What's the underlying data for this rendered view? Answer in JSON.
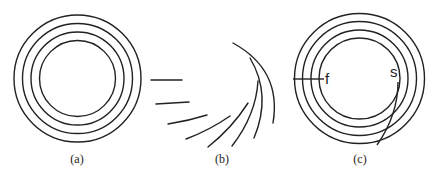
{
  "figure": {
    "panels": [
      {
        "id": "a",
        "label": "(a)",
        "description": "four concentric circles"
      },
      {
        "id": "b",
        "label": "(b)",
        "description": "seven fanned line segments / arcs"
      },
      {
        "id": "c",
        "label": "(c)",
        "description": "four concentric circles with radial line f and spiral curve s"
      }
    ],
    "annotations": {
      "f": "f",
      "s": "s"
    },
    "colors": {
      "stroke": "#222222",
      "background": "#ffffff"
    }
  }
}
